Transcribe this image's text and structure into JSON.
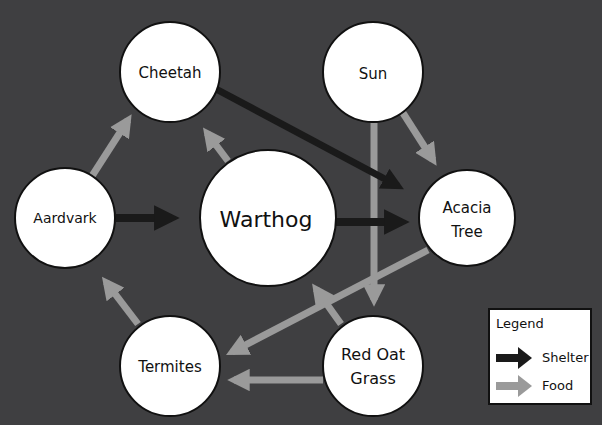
{
  "diagram": {
    "title": "",
    "colors": {
      "background": "#3f3f41",
      "shelter": "#1a1a1a",
      "food": "#9a9a9a",
      "node_fill": "#ffffff",
      "node_stroke": "#111111"
    },
    "nodes": [
      {
        "id": "cheetah",
        "label": "Cheetah",
        "cx": 170,
        "cy": 72,
        "r": 50
      },
      {
        "id": "sun",
        "label": "Sun",
        "cx": 373,
        "cy": 72,
        "r": 50
      },
      {
        "id": "aardvark",
        "label": "Aardvark",
        "cx": 65,
        "cy": 218,
        "r": 50
      },
      {
        "id": "warthog",
        "label": "Warthog",
        "cx": 268,
        "cy": 218,
        "r": 68
      },
      {
        "id": "acacia",
        "label_line1": "Acacia",
        "label_line2": "Tree",
        "cx": 467,
        "cy": 218,
        "r": 48
      },
      {
        "id": "termites",
        "label": "Termites",
        "cx": 170,
        "cy": 366,
        "r": 50
      },
      {
        "id": "redoat",
        "label_line1": "Red Oat",
        "label_line2": "Grass",
        "cx": 373,
        "cy": 366,
        "r": 50
      }
    ],
    "edges": [
      {
        "from": "Aardvark",
        "to": "Warthog",
        "type": "Shelter"
      },
      {
        "from": "Warthog",
        "to": "Acacia Tree",
        "type": "Shelter"
      },
      {
        "from": "Cheetah",
        "to": "Acacia Tree",
        "type": "Shelter"
      },
      {
        "from": "Aardvark",
        "to": "Cheetah",
        "type": "Food"
      },
      {
        "from": "Warthog",
        "to": "Cheetah",
        "type": "Food"
      },
      {
        "from": "Sun",
        "to": "Acacia Tree",
        "type": "Food"
      },
      {
        "from": "Sun",
        "to": "Red Oat Grass",
        "type": "Food"
      },
      {
        "from": "Termites",
        "to": "Aardvark",
        "type": "Food"
      },
      {
        "from": "Acacia Tree",
        "to": "Termites",
        "type": "Food"
      },
      {
        "from": "Red Oat Grass",
        "to": "Termites",
        "type": "Food"
      },
      {
        "from": "Red Oat Grass",
        "to": "Warthog",
        "type": "Food"
      }
    ]
  },
  "legend": {
    "title": "Legend",
    "items": [
      {
        "label": "Shelter",
        "color": "#1a1a1a"
      },
      {
        "label": "Food",
        "color": "#9a9a9a"
      }
    ]
  }
}
